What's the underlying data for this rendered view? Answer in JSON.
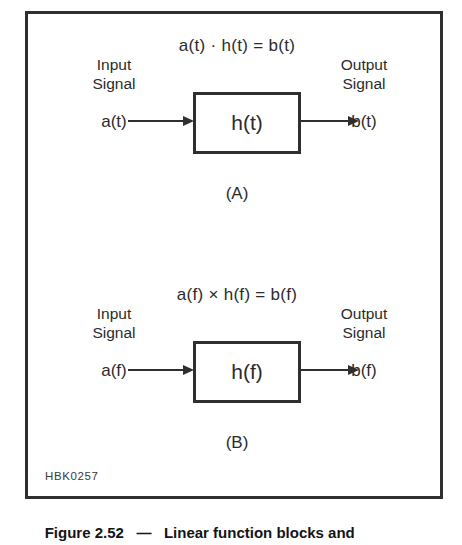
{
  "figure": {
    "plate_id": "HBK0257",
    "caption_number": "Figure 2.52",
    "caption_dash": "   —   ",
    "caption_text": "Linear function blocks and"
  },
  "panels": [
    {
      "id": "panel-a",
      "caption": "(A)",
      "equation": "a(t) · h(t) = b(t)",
      "input_label_line1": "Input",
      "input_label_line2": "Signal",
      "output_label_line1": "Output",
      "output_label_line2": "Signal",
      "input_signal": "a(t)",
      "output_signal": "b(t)",
      "block_label": "h(t)"
    },
    {
      "id": "panel-b",
      "caption": "(B)",
      "equation": "a(f) × h(f) = b(f)",
      "input_label_line1": "Input",
      "input_label_line2": "Signal",
      "output_label_line1": "Output",
      "output_label_line2": "Signal",
      "input_signal": "a(f)",
      "output_signal": "b(f)",
      "block_label": "h(f)"
    }
  ],
  "colors": {
    "ink": "#2f2f2f",
    "background": "#ffffff"
  },
  "diagram_data": {
    "type": "block-diagram",
    "description": "Two-panel linear function block diagram: time domain convolution/product and frequency domain multiplication",
    "nodes": [
      {
        "panel": "A",
        "name": "input",
        "label": "a(t)"
      },
      {
        "panel": "A",
        "name": "system-block",
        "label": "h(t)"
      },
      {
        "panel": "A",
        "name": "output",
        "label": "b(t)"
      },
      {
        "panel": "B",
        "name": "input",
        "label": "a(f)"
      },
      {
        "panel": "B",
        "name": "system-block",
        "label": "h(f)"
      },
      {
        "panel": "B",
        "name": "output",
        "label": "b(f)"
      }
    ],
    "edges": [
      {
        "panel": "A",
        "from": "a(t)",
        "to": "h(t)",
        "style": "solid-arrow"
      },
      {
        "panel": "A",
        "from": "h(t)",
        "to": "b(t)",
        "style": "solid-arrow"
      },
      {
        "panel": "B",
        "from": "a(f)",
        "to": "h(f)",
        "style": "solid-arrow"
      },
      {
        "panel": "B",
        "from": "h(f)",
        "to": "b(f)",
        "style": "solid-arrow"
      }
    ],
    "relations": [
      "a(t) · h(t) = b(t)",
      "a(f) × h(f) = b(f)"
    ]
  }
}
